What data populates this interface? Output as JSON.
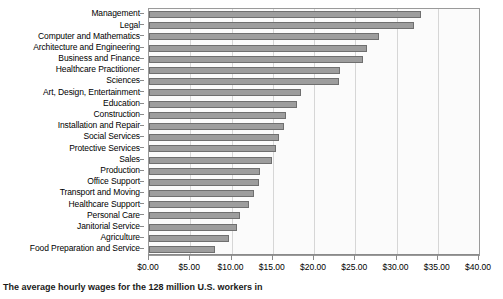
{
  "caption": "The average hourly wages for the 128 million U.S. workers in",
  "chart_data": {
    "type": "bar",
    "orientation": "horizontal",
    "title": "",
    "xlabel": "",
    "ylabel": "",
    "xlim": [
      0,
      40
    ],
    "grid": true,
    "legend": "none",
    "tick_prefix": "$",
    "tick_labels": [
      "$0.00",
      "$5.00",
      "$10.00",
      "$15.00",
      "$20.00",
      "$25.00",
      "$30.00",
      "$35.00",
      "$40.00"
    ],
    "tick_values": [
      0,
      5,
      10,
      15,
      20,
      25,
      30,
      35,
      40
    ],
    "categories": [
      "Management",
      "Legal",
      "Computer and Mathematics",
      "Architecture and Engineering",
      "Business and Finance",
      "Healthcare Practitioner",
      "Sciences",
      "Art, Design, Entertainment",
      "Education",
      "Construction",
      "Installation and Repair",
      "Social Services",
      "Protective Services",
      "Sales",
      "Production",
      "Office Support",
      "Transport and Moving",
      "Healthcare Support",
      "Personal Care",
      "Janitorial Service",
      "Agriculture",
      "Food Preparation and Service"
    ],
    "values": [
      33.0,
      32.1,
      27.9,
      26.4,
      25.9,
      23.2,
      23.0,
      18.4,
      17.9,
      16.6,
      16.4,
      15.8,
      15.4,
      14.9,
      13.4,
      13.3,
      12.7,
      12.1,
      11.0,
      10.7,
      9.7,
      8.0
    ],
    "bar_color": "#9d9d9d",
    "bar_border_color": "#6f6f6f",
    "grid_color": "#d6d6d6",
    "axis_color": "#8a8a8a"
  }
}
